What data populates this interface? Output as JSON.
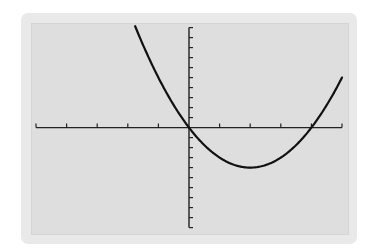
{
  "chart_data": {
    "type": "line",
    "title": "",
    "xlabel": "",
    "ylabel": "",
    "function": "y = x^2 - 4x",
    "xlim": [
      -5,
      5
    ],
    "ylim": [
      -10,
      10
    ],
    "x_tick_step": 1,
    "y_tick_step": 1,
    "grid": false,
    "legend": null,
    "series": [
      {
        "name": "curve",
        "x": [
          -1.76,
          -1.5,
          -1,
          -0.5,
          0,
          0.5,
          1,
          1.5,
          2,
          2.5,
          3,
          3.5,
          4,
          4.5,
          5
        ],
        "y": [
          10.14,
          8.25,
          5,
          2.25,
          0,
          -1.75,
          -3,
          -3.75,
          -4,
          -3.75,
          -3,
          -1.75,
          0,
          2.25,
          5
        ]
      }
    ],
    "key_points": {
      "vertex": [
        2,
        -4
      ],
      "roots": [
        0,
        4
      ],
      "y_intercept": 0
    }
  },
  "style": {
    "curve_color": "#111111",
    "axis_color": "#222222",
    "screen_bg": "#dedede",
    "frame_bg": "#e9e9e9"
  }
}
